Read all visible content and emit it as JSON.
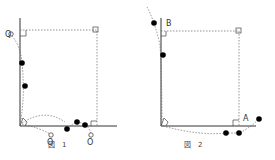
{
  "figures": [
    {
      "id": "fig1",
      "caption": "図　1",
      "labels": {
        "q": "Q",
        "o1": "O",
        "o2": "O"
      }
    },
    {
      "id": "fig2",
      "caption": "図　2",
      "labels": {
        "b": "B",
        "a": "A"
      }
    }
  ],
  "colors": {
    "line": "#333333",
    "dotted": "#666666",
    "point": "#000000"
  }
}
